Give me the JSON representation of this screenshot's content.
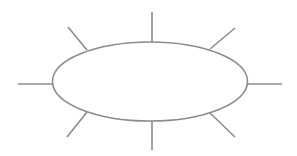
{
  "diagram": {
    "type": "spider-diagram",
    "background": "#ffffff",
    "stroke_color": "#8c8c8c",
    "stroke_width": 1.6,
    "center_node": {
      "shape": "ellipse",
      "cx": 150,
      "cy": 81.5,
      "rx": 97.5,
      "ry": 39.5,
      "label": ""
    },
    "branches": [
      {
        "name": "top",
        "x1": 152,
        "y1": 42,
        "x2": 152,
        "y2": 12
      },
      {
        "name": "top-right",
        "x1": 210,
        "y1": 49,
        "x2": 235,
        "y2": 28
      },
      {
        "name": "right",
        "x1": 247.5,
        "y1": 84,
        "x2": 282,
        "y2": 84
      },
      {
        "name": "bottom-right",
        "x1": 210,
        "y1": 113,
        "x2": 235,
        "y2": 137
      },
      {
        "name": "bottom",
        "x1": 152,
        "y1": 121,
        "x2": 152,
        "y2": 150
      },
      {
        "name": "bottom-left",
        "x1": 87,
        "y1": 112,
        "x2": 67,
        "y2": 137
      },
      {
        "name": "left",
        "x1": 52.5,
        "y1": 84,
        "x2": 18,
        "y2": 84
      },
      {
        "name": "top-left",
        "x1": 87,
        "y1": 50,
        "x2": 68,
        "y2": 27
      }
    ]
  }
}
